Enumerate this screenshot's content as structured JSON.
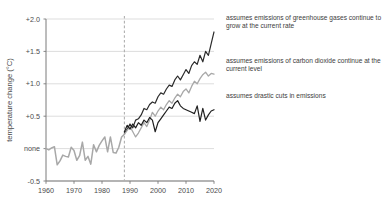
{
  "chart_data": {
    "type": "line",
    "title": "",
    "xlabel": "",
    "ylabel": "temperature change (°C)",
    "xlim": [
      1960,
      2020
    ],
    "ylim": [
      -0.5,
      2.0
    ],
    "grid": true,
    "legend_position": "right-inline-annotations",
    "x_ticks": [
      1960,
      1970,
      1980,
      1990,
      2000,
      2010,
      2020
    ],
    "x_tick_labels": [
      "1960",
      "1970",
      "1980",
      "1990",
      "2000",
      "2010",
      "2020"
    ],
    "y_ticks": [
      -0.5,
      0.0,
      0.5,
      1.0,
      1.5,
      2.0
    ],
    "y_tick_labels": [
      "-0.5",
      "none",
      "+0.5",
      "+1.0",
      "+1.5",
      "+2.0"
    ],
    "divider_x": 1988,
    "divider_note": "dashed vertical line separating observed record from projections",
    "colors": {
      "historical": "#a8a8a8",
      "high_emissions": "#2b2b2b",
      "constant_co2": "#a8a8a8",
      "drastic_cuts": "#1f1f1f",
      "grid": "#cfcfcf",
      "axis": "#7a7a7a",
      "text": "#3c3c3c"
    },
    "series": [
      {
        "name": "historical",
        "label": "observed temperature record",
        "color": "#a8a8a8",
        "width": 1.5,
        "x": [
          1960,
          1961,
          1962,
          1963,
          1964,
          1965,
          1966,
          1967,
          1968,
          1969,
          1970,
          1971,
          1972,
          1973,
          1974,
          1975,
          1976,
          1977,
          1978,
          1979,
          1980,
          1981,
          1982,
          1983,
          1984,
          1985,
          1986,
          1987,
          1988
        ],
        "values": [
          0.0,
          -0.02,
          0.01,
          0.03,
          -0.25,
          -0.19,
          -0.1,
          -0.12,
          -0.13,
          0.02,
          -0.03,
          -0.18,
          -0.11,
          0.1,
          -0.18,
          -0.12,
          -0.24,
          0.06,
          -0.05,
          0.05,
          0.12,
          0.18,
          -0.05,
          0.18,
          -0.06,
          -0.07,
          0.02,
          0.18,
          0.22
        ]
      },
      {
        "name": "high_emissions",
        "label": "assumes emissions of greenhouse gases continue to grow at the current rate",
        "color": "#2b2b2b",
        "width": 1.2,
        "x": [
          1988,
          1989,
          1990,
          1991,
          1992,
          1993,
          1994,
          1995,
          1996,
          1997,
          1998,
          1999,
          2000,
          2001,
          2002,
          2003,
          2004,
          2005,
          2006,
          2007,
          2008,
          2009,
          2010,
          2011,
          2012,
          2013,
          2014,
          2015,
          2016,
          2017,
          2018,
          2019,
          2020
        ],
        "values": [
          0.24,
          0.3,
          0.38,
          0.32,
          0.44,
          0.46,
          0.52,
          0.62,
          0.6,
          0.68,
          0.72,
          0.7,
          0.8,
          0.86,
          0.84,
          0.92,
          0.98,
          0.96,
          1.06,
          1.12,
          1.06,
          1.14,
          1.22,
          1.16,
          1.28,
          1.34,
          1.3,
          1.44,
          1.34,
          1.5,
          1.44,
          1.62,
          1.8
        ]
      },
      {
        "name": "constant_co2",
        "label": "assumes emissions of carbon dioxide continue at the current level",
        "color": "#a8a8a8",
        "width": 1.3,
        "x": [
          1988,
          1989,
          1990,
          1991,
          1992,
          1993,
          1994,
          1995,
          1996,
          1997,
          1998,
          1999,
          2000,
          2001,
          2002,
          2003,
          2004,
          2005,
          2006,
          2007,
          2008,
          2009,
          2010,
          2011,
          2012,
          2013,
          2014,
          2015,
          2016,
          2017,
          2018,
          2019,
          2020
        ],
        "values": [
          0.22,
          0.28,
          0.34,
          0.26,
          0.18,
          0.24,
          0.32,
          0.4,
          0.34,
          0.44,
          0.56,
          0.5,
          0.58,
          0.64,
          0.6,
          0.68,
          0.74,
          0.7,
          0.78,
          0.84,
          0.8,
          0.88,
          0.92,
          0.86,
          0.96,
          1.04,
          1.0,
          1.08,
          1.14,
          1.18,
          1.12,
          1.16,
          1.15
        ]
      },
      {
        "name": "drastic_cuts",
        "label": "assumes drastic cuts in emissions",
        "color": "#1f1f1f",
        "width": 1.2,
        "x": [
          1988,
          1989,
          1990,
          1991,
          1992,
          1993,
          1994,
          1995,
          1996,
          1997,
          1998,
          1999,
          2000,
          2001,
          2002,
          2003,
          2004,
          2005,
          2006,
          2007,
          2008,
          2009,
          2010,
          2011,
          2012,
          2013,
          2014,
          2015,
          2016,
          2017,
          2018,
          2019,
          2020
        ],
        "values": [
          0.26,
          0.36,
          0.3,
          0.38,
          0.32,
          0.4,
          0.36,
          0.44,
          0.4,
          0.48,
          0.44,
          0.26,
          0.4,
          0.46,
          0.52,
          0.58,
          0.64,
          0.62,
          0.7,
          0.74,
          0.66,
          0.62,
          0.6,
          0.58,
          0.56,
          0.54,
          0.66,
          0.42,
          0.62,
          0.44,
          0.52,
          0.58,
          0.6
        ]
      }
    ],
    "annotations": [
      {
        "id": "anno-0",
        "text": "assumes emissions of greenhouse gases continue to grow at the current rate",
        "target_series": "high_emissions"
      },
      {
        "id": "anno-1",
        "text": "assumes emissions of  carbon dioxide continue at the current level",
        "target_series": "constant_co2"
      },
      {
        "id": "anno-2",
        "text": "assumes drastic cuts in emissions",
        "target_series": "drastic_cuts"
      }
    ]
  }
}
